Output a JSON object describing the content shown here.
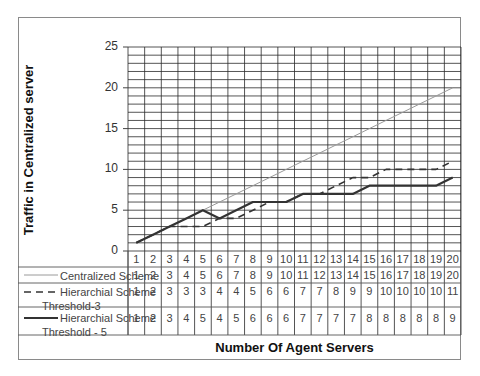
{
  "chart_data": {
    "type": "line",
    "title": "",
    "xlabel": "Number Of Agent Servers",
    "ylabel": "Traffic in Centralized server",
    "ylim": [
      0,
      25
    ],
    "yticks": [
      0,
      5,
      10,
      15,
      20,
      25
    ],
    "grid": true,
    "legend_position": "data-table-below",
    "categories": [
      1,
      2,
      3,
      4,
      5,
      6,
      7,
      8,
      9,
      10,
      11,
      12,
      13,
      14,
      15,
      16,
      17,
      18,
      19,
      20
    ],
    "series": [
      {
        "name": "Centralized Scheme",
        "style": "thin-solid",
        "color": "#9a9a9a",
        "values": [
          1,
          2,
          3,
          4,
          5,
          6,
          7,
          8,
          9,
          10,
          11,
          12,
          13,
          14,
          15,
          16,
          17,
          18,
          19,
          20
        ]
      },
      {
        "name": "Hierarchial Scheme Threshold-3",
        "style": "dashed",
        "color": "#333333",
        "values": [
          1,
          2,
          3,
          3,
          3,
          4,
          4,
          5,
          6,
          6,
          7,
          7,
          8,
          9,
          9,
          10,
          10,
          10,
          10,
          11
        ]
      },
      {
        "name": "Hierarchial Scheme Threshold - 5",
        "style": "thick-solid",
        "color": "#333333",
        "values": [
          1,
          2,
          3,
          4,
          5,
          4,
          5,
          6,
          6,
          6,
          7,
          7,
          7,
          7,
          8,
          8,
          8,
          8,
          8,
          9
        ]
      }
    ]
  },
  "legend": {
    "centralized": "Centralized Scheme",
    "threshold3_line1": "Hierarchial Scheme",
    "threshold3_line2": "Threshold-3",
    "threshold5_line1": "Hierarchial Scheme",
    "threshold5_line2": "Threshold - 5"
  }
}
